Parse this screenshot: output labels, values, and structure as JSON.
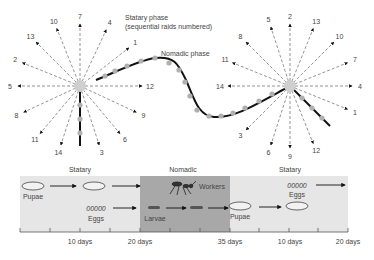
{
  "diagram": {
    "title_statary": "Statary phase",
    "subtitle_statary": "(sequential raids numbered)",
    "nomadic_label": "Nomadic phase",
    "left_burst": {
      "center": [
        80,
        86
      ],
      "rays": [
        {
          "label": "7",
          "angle": 90
        },
        {
          "label": "4",
          "angle": 65
        },
        {
          "label": "1",
          "angle": 38
        },
        {
          "label": "12",
          "angle": 0
        },
        {
          "label": "9",
          "angle": -25
        },
        {
          "label": "6",
          "angle": -50
        },
        {
          "label": "3",
          "angle": -72
        },
        {
          "label": "14",
          "angle": -108
        },
        {
          "label": "11",
          "angle": -130
        },
        {
          "label": "8",
          "angle": -155
        },
        {
          "label": "5",
          "angle": 180
        },
        {
          "label": "2",
          "angle": 158
        },
        {
          "label": "13",
          "angle": 135
        },
        {
          "label": "10",
          "angle": 112
        }
      ]
    },
    "right_burst": {
      "center": [
        290,
        86
      ],
      "rays": [
        {
          "label": "2",
          "angle": 90
        },
        {
          "label": "13",
          "angle": 68
        },
        {
          "label": "10",
          "angle": 45
        },
        {
          "label": "7",
          "angle": 22
        },
        {
          "label": "4",
          "angle": 0
        },
        {
          "label": "1",
          "angle": -22
        },
        {
          "label": "12",
          "angle": -68
        },
        {
          "label": "9",
          "angle": -90
        },
        {
          "label": "6",
          "angle": -108
        },
        {
          "label": "3",
          "angle": -135
        },
        {
          "label": "14",
          "angle": 180
        },
        {
          "label": "11",
          "angle": 158
        },
        {
          "label": "8",
          "angle": 135
        },
        {
          "label": "5",
          "angle": 108
        }
      ]
    },
    "timeline": {
      "phases": [
        {
          "label": "Statary",
          "x": 80
        },
        {
          "label": "Nomadic",
          "x": 183
        },
        {
          "label": "Statary",
          "x": 290
        }
      ],
      "stage_labels": {
        "pupae_1": "Pupae",
        "eggs_1": "Eggs",
        "eggs_glyph": "00000",
        "larvae": "Larvae",
        "workers": "Workers",
        "pupae_2": "Pupae",
        "eggs_2": "Eggs"
      },
      "tick_labels": [
        {
          "label": "10 days",
          "x": 80
        },
        {
          "label": "20 days",
          "x": 140
        },
        {
          "label": "35 days",
          "x": 230
        },
        {
          "label": "10 days",
          "x": 290
        },
        {
          "label": "20 days",
          "x": 348
        }
      ]
    },
    "colors": {
      "statary_band": "#e6e6e6",
      "nomadic_band": "#a8a8a8",
      "path": "#111111",
      "dots": "#b0b0b0",
      "rays": "#666666"
    }
  }
}
